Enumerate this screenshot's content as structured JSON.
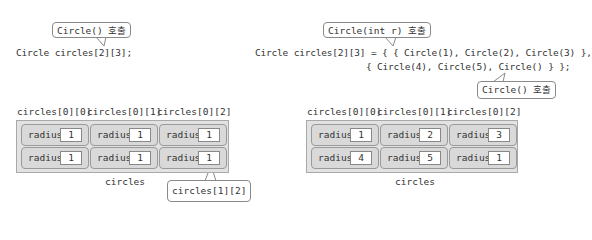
{
  "left": {
    "callout_top": "Circle() 호출",
    "code": "Circle circles[2][3];",
    "column_labels": [
      "circles[0][0]",
      "circles[0][1]",
      "circles[0][2]"
    ],
    "rows": [
      [
        {
          "label": "radius",
          "value": "1"
        },
        {
          "label": "radius",
          "value": "1"
        },
        {
          "label": "radius",
          "value": "1"
        }
      ],
      [
        {
          "label": "radius",
          "value": "1"
        },
        {
          "label": "radius",
          "value": "1"
        },
        {
          "label": "radius",
          "value": "1"
        }
      ]
    ],
    "array_name": "circles",
    "callout_bottom": "circles[1][2]"
  },
  "right": {
    "callout_top": "Circle(int r) 호출",
    "code_line1": "Circle circles[2][3] = { { Circle(1), Circle(2), Circle(3) },",
    "code_line2": "{ Circle(4), Circle(5), Circle() } };",
    "callout_bottom": "Circle() 호출",
    "column_labels": [
      "circles[0][0]",
      "circles[0][1]",
      "circles[0][2]"
    ],
    "rows": [
      [
        {
          "label": "radius",
          "value": "1"
        },
        {
          "label": "radius",
          "value": "2"
        },
        {
          "label": "radius",
          "value": "3"
        }
      ],
      [
        {
          "label": "radius",
          "value": "4"
        },
        {
          "label": "radius",
          "value": "5"
        },
        {
          "label": "radius",
          "value": "1"
        }
      ]
    ],
    "array_name": "circles"
  }
}
